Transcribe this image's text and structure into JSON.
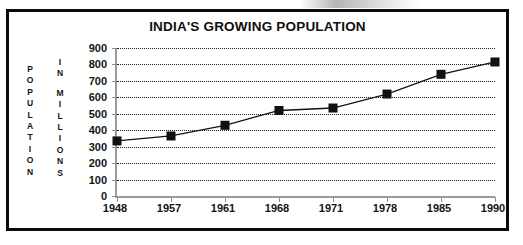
{
  "chart_data": {
    "type": "line",
    "title": "INDIA'S GROWING POPULATION",
    "xlabel": "",
    "ylabel": "POPULATION IN MILLIONS",
    "ylabel_stacked": [
      "POPULATION",
      "IN MILLIONS"
    ],
    "categories": [
      "1948",
      "1957",
      "1961",
      "1968",
      "1971",
      "1978",
      "1985",
      "1990"
    ],
    "values": [
      335,
      365,
      430,
      520,
      535,
      620,
      740,
      815
    ],
    "ylim": [
      0,
      900
    ],
    "ytick_values": [
      0,
      100,
      200,
      300,
      400,
      500,
      600,
      700,
      800,
      900
    ],
    "ytick_labels": [
      "0",
      "100",
      "200",
      "300",
      "400",
      "500",
      "600",
      "700",
      "800",
      "900"
    ],
    "grid": true,
    "grid_style": "dotted",
    "legend": false,
    "marker": "filled-square",
    "series_color": "#111111",
    "grid_color": "#1c1c1c",
    "axis_color": "#9a9a9a",
    "frame_color": "#0a0a0a",
    "title_color": "#101010"
  },
  "axis_captions": {
    "population_letters": [
      "P",
      "O",
      "P",
      "U",
      "L",
      "A",
      "T",
      "I",
      "O",
      "N"
    ],
    "in_letters": [
      "I",
      "N"
    ],
    "millions_letters": [
      "M",
      "I",
      "L",
      "L",
      "I",
      "O",
      "N",
      "S"
    ]
  }
}
